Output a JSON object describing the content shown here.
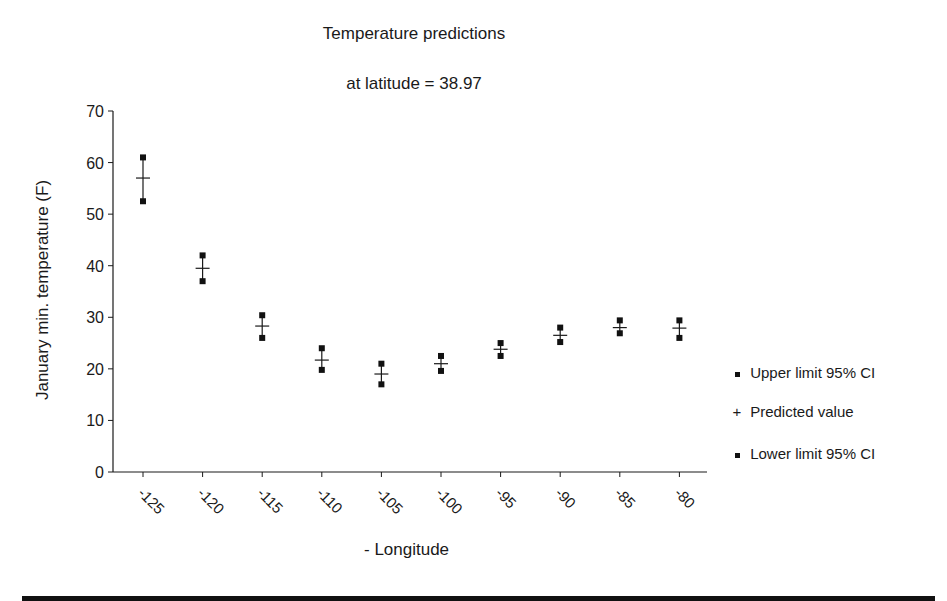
{
  "chart_data": {
    "type": "scatter",
    "title": "Temperature predictions",
    "subtitle": "at latitude = 38.97",
    "xlabel": "- Longitude",
    "ylabel": "January min. temperature (F)",
    "categories": [
      "-125",
      "-120",
      "-115",
      "-110",
      "-105",
      "-100",
      "-95",
      "-90",
      "-85",
      "-80"
    ],
    "x": [
      -125,
      -120,
      -115,
      -110,
      -105,
      -100,
      -95,
      -90,
      -85,
      -80
    ],
    "series": [
      {
        "name": "Upper limit 95% CI",
        "marker": "square",
        "values": [
          61,
          42,
          30.4,
          24,
          21,
          22.5,
          25,
          28,
          29.4,
          29.4
        ]
      },
      {
        "name": "Predicted value",
        "marker": "plus",
        "values": [
          57,
          39.5,
          28.3,
          21.7,
          19,
          21,
          23.8,
          26.5,
          28,
          27.9
        ]
      },
      {
        "name": "Lower limit 95% CI",
        "marker": "square",
        "values": [
          52.5,
          37,
          26,
          19.8,
          17,
          19.6,
          22.5,
          25.2,
          26.9,
          26
        ]
      }
    ],
    "yticks": [
      0,
      10,
      20,
      30,
      40,
      50,
      60,
      70
    ],
    "ylim": [
      0,
      70
    ],
    "grid": false,
    "legend_position": "right"
  },
  "legend": {
    "items": [
      {
        "label": "Upper limit 95% CI",
        "symbol": "square"
      },
      {
        "label": "Predicted value",
        "symbol": "+"
      },
      {
        "label": "Lower limit 95% CI",
        "symbol": "square"
      }
    ]
  },
  "colors": {
    "ink": "#1a1a1a",
    "marker": "#111111"
  }
}
